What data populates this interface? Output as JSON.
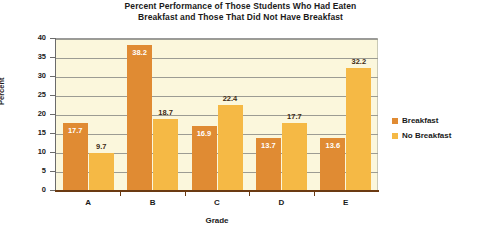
{
  "chart_data": {
    "type": "bar",
    "title": "Percent Performance of Those Students Who Had Eaten Breakfast and Those That Did Not Have Breakfast",
    "title_line1": "Percent Performance of Those Students Who Had Eaten",
    "title_line2": "Breakfast and Those That Did Not Have Breakfast",
    "xlabel": "Grade",
    "ylabel": "Percent",
    "categories": [
      "A",
      "B",
      "C",
      "D",
      "E"
    ],
    "series": [
      {
        "name": "Breakfast",
        "color": "#e08b33",
        "values": [
          17.7,
          38.2,
          16.9,
          13.7,
          13.6
        ]
      },
      {
        "name": "No Breakfast",
        "color": "#f5b945",
        "values": [
          9.7,
          18.7,
          22.4,
          17.7,
          32.2
        ]
      }
    ],
    "ylim": [
      0,
      40
    ],
    "yticks": [
      "0",
      "5",
      "10",
      "15",
      "20",
      "25",
      "30",
      "35",
      "40"
    ],
    "grid": true,
    "legend_position": "right",
    "plot_background": "#fbf7dc",
    "axis_color": "#6b3a12"
  },
  "legend": {
    "items": [
      {
        "label": "Breakfast"
      },
      {
        "label": "No Breakfast"
      }
    ]
  }
}
